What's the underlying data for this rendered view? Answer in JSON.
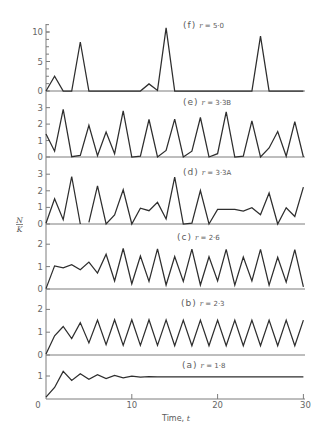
{
  "figure": {
    "y_label": {
      "numerator": "N",
      "denominator": "K"
    },
    "x_label": {
      "text": "Time, ",
      "var": "t"
    },
    "panels": [
      {
        "tag": "(f)",
        "param": "r",
        "value": " = 5·0"
      },
      {
        "tag": "(e)",
        "param": "r",
        "value": " = 3·3B"
      },
      {
        "tag": "(d)",
        "param": "r",
        "value": " = 3·3A"
      },
      {
        "tag": "(c)",
        "param": "r",
        "value": " = 2·6"
      },
      {
        "tag": "(b)",
        "param": "r",
        "value": " = 2·3"
      },
      {
        "tag": "(a)",
        "param": "r",
        "value": " = 1·8"
      }
    ]
  },
  "chart_data": [
    {
      "type": "line",
      "title": "(f) r = 5·0",
      "xlabel": "Time, t",
      "ylabel": "N/K",
      "x": [
        0,
        1,
        2,
        3,
        4,
        5,
        6,
        7,
        8,
        9,
        10,
        11,
        12,
        13,
        14,
        15,
        16,
        17,
        18,
        19,
        20,
        21,
        22,
        23,
        24,
        25,
        26,
        27,
        28,
        29,
        30
      ],
      "series": [
        {
          "name": "r = 5.0",
          "values": [
            0,
            2.5,
            0,
            0,
            8.3,
            0,
            0,
            0,
            0,
            0,
            0,
            0,
            1.2,
            0.1,
            10.7,
            0,
            0,
            0,
            0,
            0,
            0,
            0,
            0,
            0,
            0,
            9.3,
            0,
            0,
            0,
            0,
            0
          ]
        }
      ],
      "ylim": [
        0,
        11.25
      ],
      "yticks": [
        0,
        5,
        10
      ],
      "ytick_labels": [
        "0",
        "5",
        "10"
      ],
      "minor_tick_step": 1.25,
      "grid": false
    },
    {
      "type": "line",
      "title": "(e) r = 3·3B",
      "xlabel": "Time, t",
      "ylabel": "N/K",
      "x": [
        0,
        1,
        2,
        3,
        4,
        5,
        6,
        7,
        8,
        9,
        10,
        11,
        12,
        13,
        14,
        15,
        16,
        17,
        18,
        19,
        20,
        21,
        22,
        23,
        24,
        25,
        26,
        27,
        28,
        29,
        30
      ],
      "series": [
        {
          "name": "r = 3.3 (B)",
          "values": [
            1.4,
            0.35,
            2.9,
            0.02,
            0.1,
            1.92,
            0.08,
            1.52,
            0.2,
            2.8,
            0,
            0.05,
            2.28,
            0,
            0.4,
            2.3,
            0,
            0.35,
            2.4,
            0,
            0.2,
            2.75,
            0,
            0.05,
            2.2,
            0,
            0.55,
            1.55,
            0.05,
            2.15,
            0
          ]
        }
      ],
      "ylim": [
        0,
        3.4
      ],
      "yticks": [
        0,
        1,
        2,
        3
      ],
      "ytick_labels": [
        "0",
        "1",
        "2",
        "3"
      ],
      "grid": false
    },
    {
      "type": "line",
      "title": "(d) r = 3·3A",
      "xlabel": "Time, t",
      "ylabel": "N/K",
      "x": [
        0,
        1,
        2,
        3,
        4,
        5,
        6,
        7,
        8,
        9,
        10,
        11,
        12,
        13,
        14,
        15,
        16,
        17,
        18,
        19,
        20,
        21,
        22,
        23,
        24,
        25,
        26,
        27,
        28,
        29,
        30
      ],
      "series": [
        {
          "name": "r = 3.3 (A)",
          "values": [
            0.05,
            1.52,
            0.26,
            2.86,
            0,
            0.1,
            2.3,
            0,
            0.55,
            2.06,
            0,
            0.95,
            0.8,
            1.3,
            0.3,
            2.82,
            0,
            0.05,
            2.02,
            0,
            0.88,
            0.88,
            0.88,
            0.78,
            0.98,
            0.56,
            1.87,
            0,
            0.98,
            0.45,
            2.22
          ],
          "gaps_after": [
            4
          ]
        }
      ],
      "ylim": [
        0,
        3.4
      ],
      "yticks": [
        0,
        1,
        2,
        3
      ],
      "ytick_labels": [
        "0",
        "1",
        "2",
        "3"
      ],
      "grid": false
    },
    {
      "type": "line",
      "title": "(c) r = 2·6",
      "xlabel": "Time, t",
      "ylabel": "N/K",
      "x": [
        0,
        1,
        2,
        3,
        4,
        5,
        6,
        7,
        8,
        9,
        10,
        11,
        12,
        13,
        14,
        15,
        16,
        17,
        18,
        19,
        20,
        21,
        22,
        23,
        24,
        25,
        26,
        27,
        28,
        29,
        30
      ],
      "series": [
        {
          "name": "r = 2.6",
          "values": [
            0.02,
            1.03,
            0.94,
            1.09,
            0.86,
            1.2,
            0.71,
            1.55,
            0.36,
            1.81,
            0.23,
            1.47,
            0.34,
            1.79,
            0.18,
            1.45,
            0.34,
            1.78,
            0.18,
            1.44,
            0.36,
            1.77,
            0.17,
            1.43,
            0.36,
            1.77,
            0.17,
            1.42,
            0.31,
            1.76,
            0.1
          ]
        }
      ],
      "ylim": [
        0,
        2.9
      ],
      "yticks": [
        0,
        1,
        2
      ],
      "ytick_labels": [
        "0",
        "1",
        "2"
      ],
      "grid": false
    },
    {
      "type": "line",
      "title": "(b) r = 2·3",
      "xlabel": "Time, t",
      "ylabel": "N/K",
      "x": [
        0,
        1,
        2,
        3,
        4,
        5,
        6,
        7,
        8,
        9,
        10,
        11,
        12,
        13,
        14,
        15,
        16,
        17,
        18,
        19,
        20,
        21,
        22,
        23,
        24,
        25,
        26,
        27,
        28,
        29,
        30
      ],
      "series": [
        {
          "name": "r = 2.3",
          "values": [
            0.05,
            0.84,
            1.25,
            0.72,
            1.42,
            0.53,
            1.53,
            0.45,
            1.55,
            0.42,
            1.55,
            0.42,
            1.55,
            0.42,
            1.54,
            0.41,
            1.53,
            0.41,
            1.53,
            0.41,
            1.53,
            0.41,
            1.53,
            0.41,
            1.53,
            0.41,
            1.53,
            0.41,
            1.53,
            0.41,
            1.53
          ]
        }
      ],
      "ylim": [
        0,
        2.9
      ],
      "yticks": [
        0,
        1,
        2
      ],
      "ytick_labels": [
        "0",
        "1",
        "2"
      ],
      "grid": false
    },
    {
      "type": "line",
      "title": "(a) r = 1·8",
      "xlabel": "Time, t",
      "ylabel": "N/K",
      "x": [
        0,
        1,
        2,
        3,
        4,
        5,
        6,
        7,
        8,
        9,
        10,
        11,
        12,
        13,
        14,
        15,
        16,
        17,
        18,
        19,
        20,
        21,
        22,
        23,
        24,
        25,
        26,
        27,
        28,
        29,
        30
      ],
      "series": [
        {
          "name": "r = 1.8",
          "values": [
            0.08,
            0.5,
            1.2,
            0.81,
            1.1,
            0.86,
            1.06,
            0.89,
            1.03,
            0.92,
            0.99,
            0.95,
            0.97,
            0.96,
            0.96,
            0.96,
            0.96,
            0.96,
            0.96,
            0.96,
            0.96,
            0.96,
            0.96,
            0.96,
            0.96,
            0.96,
            0.96,
            0.96,
            0.96,
            0.96,
            0.96
          ]
        }
      ],
      "ylim": [
        0,
        1.9
      ],
      "yticks": [
        1
      ],
      "ytick_labels": [
        "1"
      ],
      "xlim": [
        0,
        30
      ],
      "xticks": [
        0,
        10,
        20,
        30
      ],
      "xtick_labels": [
        "0",
        "10",
        "20",
        "30"
      ],
      "grid": false
    }
  ]
}
